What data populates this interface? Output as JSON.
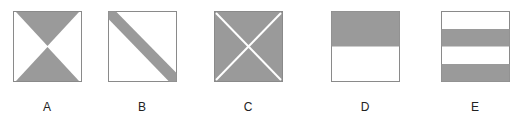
{
  "colors": {
    "fill": "#9a9a9a",
    "stroke": "#8a8a8a",
    "background": "#ffffff"
  },
  "figures": [
    {
      "label": "A",
      "description": "square with top and bottom triangles shaded (hourglass)"
    },
    {
      "label": "B",
      "description": "square with diagonal band from top-left to bottom-right shaded"
    },
    {
      "label": "C",
      "description": "fully shaded square divided by white X diagonals"
    },
    {
      "label": "D",
      "description": "square with top half shaded"
    },
    {
      "label": "E",
      "description": "square with four horizontal stripes, 2nd and 4th shaded"
    }
  ]
}
